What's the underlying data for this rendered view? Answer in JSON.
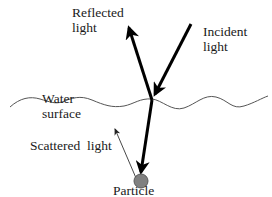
{
  "diagram": {
    "labels": {
      "reflected_line1": "Reflected",
      "reflected_line2": "light",
      "incident_line1": "Incident",
      "incident_line2": "light",
      "water_line1": "Water",
      "water_line2": "surface",
      "scattered": "Scattered  light",
      "particle": "Particle"
    },
    "colors": {
      "arrow": "#000000",
      "surface": "#555555",
      "particle_fill": "#808080",
      "particle_stroke": "#5a5a5a"
    }
  }
}
